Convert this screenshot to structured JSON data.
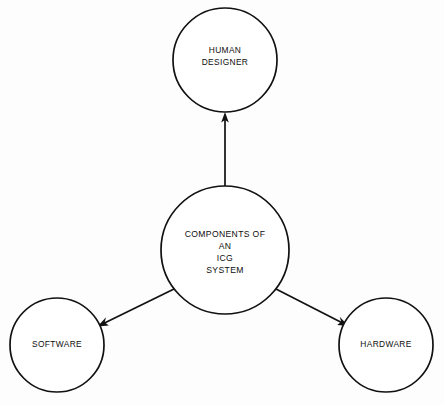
{
  "diagram": {
    "type": "hub-and-spoke concept diagram",
    "background_color": "#fdfdfd",
    "stroke_color": "#111111",
    "text_color": "#0d0d0d",
    "nodes": [
      {
        "id": "human-designer",
        "label_lines": [
          "HUMAN",
          "DESIGNER"
        ],
        "line1": "HUMAN",
        "line2": "DESIGNER",
        "cx": 225,
        "cy": 60,
        "r": 52
      },
      {
        "id": "components-hub",
        "label_lines": [
          "COMPONENTS OF",
          "AN",
          "ICG",
          "SYSTEM"
        ],
        "line1": "COMPONENTS OF",
        "line2": "AN",
        "line3": "ICG",
        "line4": "SYSTEM",
        "cx": 225,
        "cy": 250,
        "r": 64
      },
      {
        "id": "software",
        "label_lines": [
          "SOFTWARE"
        ],
        "line1": "SOFTWARE",
        "cx": 57,
        "cy": 345,
        "r": 47
      },
      {
        "id": "hardware",
        "label_lines": [
          "HARDWARE"
        ],
        "line1": "HARDWARE",
        "cx": 386,
        "cy": 345,
        "r": 47
      }
    ],
    "edges": [
      {
        "id": "hub-to-human-designer",
        "from": "components-hub",
        "to": "human-designer",
        "direction": "up",
        "arrowhead": "at human-designer"
      },
      {
        "id": "hub-to-software",
        "from": "components-hub",
        "to": "software",
        "direction": "down-left",
        "arrowhead": "at software"
      },
      {
        "id": "hub-to-hardware",
        "from": "components-hub",
        "to": "hardware",
        "direction": "down-right",
        "arrowhead": "at hardware"
      }
    ]
  }
}
